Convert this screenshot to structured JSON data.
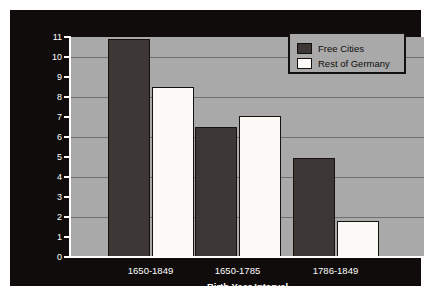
{
  "chart_data": {
    "type": "bar",
    "title": "",
    "xlabel": "Birth Year Interval",
    "ylabel": "Composers Born per Million Population",
    "categories": [
      "1650-1849",
      "1650-1785",
      "1786-1849"
    ],
    "series": [
      {
        "name": "Free Cities",
        "color": "#3d3735",
        "values": [
          10.9,
          6.5,
          4.95
        ]
      },
      {
        "name": "Rest of Germany",
        "color": "#fbfaf6",
        "values": [
          8.5,
          7.05,
          1.8
        ]
      }
    ],
    "ylim": [
      0,
      11
    ],
    "y_ticks": [
      0,
      1,
      2,
      3,
      4,
      5,
      6,
      7,
      8,
      9,
      10,
      11
    ],
    "y_tick_labels": [
      "0",
      "1",
      "2",
      "3",
      "4",
      "5",
      "6",
      "7",
      "8",
      "9",
      "10",
      "11"
    ],
    "gridlines": [
      2,
      4,
      6,
      8,
      10
    ],
    "grid": true,
    "legend_position": "top-right",
    "plot_background": "#a9a9a9",
    "panel_background": "#100c0b",
    "axis_text_color": "#ffffff",
    "gridline_color": "#6f6f6f"
  },
  "legend": {
    "entries": [
      {
        "label": "Free Cities",
        "color": "#3d3735"
      },
      {
        "label": "Rest of Germany",
        "color": "#fbfaf6"
      }
    ]
  }
}
